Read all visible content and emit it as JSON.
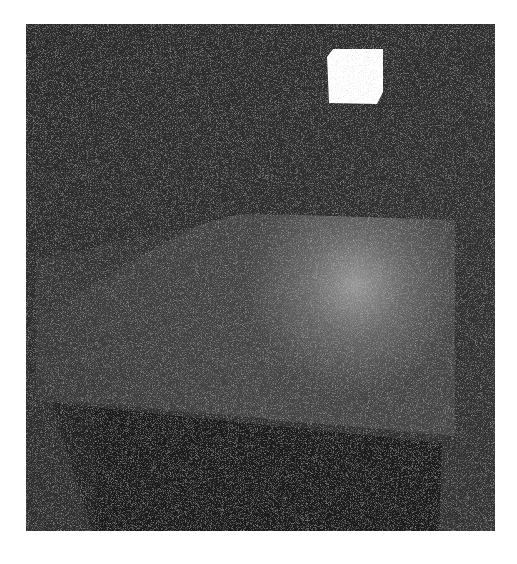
{
  "scene": {
    "description": "Noisy path-traced render of a dim room with an emissive light cube above a floor plane and a dark box in the foreground",
    "frame": {
      "x": 26,
      "y": 24,
      "width": 469,
      "height": 507,
      "background": "#2b2b2b"
    },
    "light_cube": {
      "color": "#ffffff",
      "points": "333,49 383,49 383,92 377,104 329,103 327,57"
    },
    "floor": {
      "color": "#4a4a4a",
      "points": "196,226 240,216 455,222 455,435 60,400 50,380 140,260",
      "highlight": {
        "cx": 355,
        "cy": 285,
        "r": 95,
        "color": "#9a9a9a"
      }
    },
    "dark_box": {
      "color": "#1a1a1a",
      "points": "52,403 442,443 439,531 92,531"
    }
  }
}
